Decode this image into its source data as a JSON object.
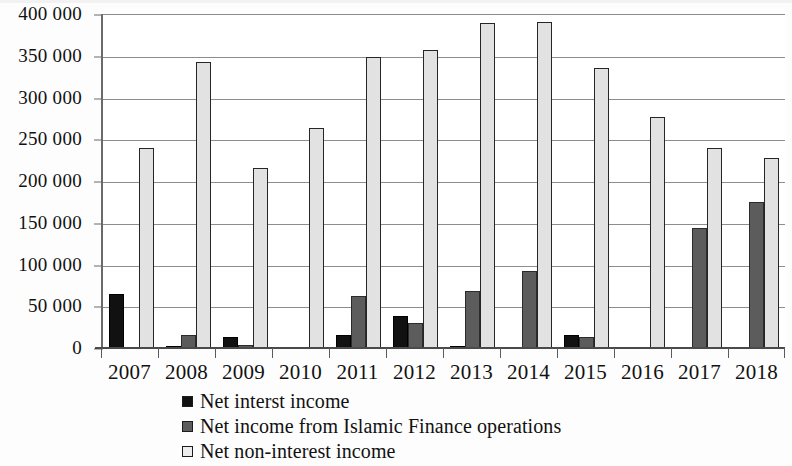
{
  "chart_data": {
    "type": "bar",
    "title": "",
    "subtitle": "",
    "xlabel": "",
    "ylabel": "",
    "categories": [
      "2007",
      "2008",
      "2009",
      "2010",
      "2011",
      "2012",
      "2013",
      "2014",
      "2015",
      "2016",
      "2017",
      "2018"
    ],
    "series": [
      {
        "name": "Net interst income",
        "color": "#111111",
        "values": [
          65000,
          3000,
          13000,
          1000,
          15000,
          38000,
          2000,
          0,
          16000,
          1000,
          0,
          0
        ]
      },
      {
        "name": "Net income from Islamic Finance operations",
        "color": "#5c5c5c",
        "values": [
          0,
          15000,
          4000,
          1000,
          62000,
          30000,
          68000,
          92000,
          13000,
          1000,
          144000,
          175000
        ]
      },
      {
        "name": "Net non-interest income",
        "color": "#e2e2e2",
        "values": [
          240000,
          343000,
          216000,
          264000,
          348000,
          357000,
          389000,
          390000,
          335000,
          277000,
          239000,
          228000
        ]
      }
    ],
    "ylim": [
      0,
      400000
    ],
    "ytick_values": [
      0,
      50000,
      100000,
      150000,
      200000,
      250000,
      300000,
      350000,
      400000
    ],
    "ytick_labels": [
      "0",
      "50 000",
      "100 000",
      "150 000",
      "200 000",
      "250 000",
      "300 000",
      "350 000",
      "400 000"
    ],
    "grid": true,
    "legend_position": "bottom"
  },
  "legend": {
    "items": [
      {
        "label": "Net interst income",
        "swatch": "black-square-icon"
      },
      {
        "label": "Net income from Islamic Finance operations",
        "swatch": "dark-grey-square-icon"
      },
      {
        "label": "Net non-interest income",
        "swatch": "light-grey-square-icon"
      }
    ]
  }
}
